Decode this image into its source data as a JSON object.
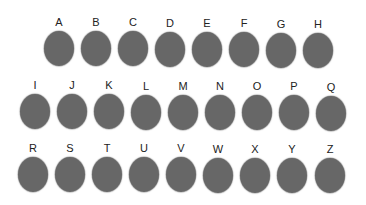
{
  "colors": {
    "circle": "#676767",
    "label": "#222222",
    "background": "#ffffff"
  },
  "rows": [
    {
      "letters": [
        "A",
        "B",
        "C",
        "D",
        "E",
        "F",
        "G",
        "H"
      ]
    },
    {
      "letters": [
        "I",
        "J",
        "K",
        "L",
        "M",
        "N",
        "O",
        "P",
        "Q"
      ]
    },
    {
      "letters": [
        "R",
        "S",
        "T",
        "U",
        "V",
        "W",
        "X",
        "Y",
        "Z"
      ]
    }
  ]
}
